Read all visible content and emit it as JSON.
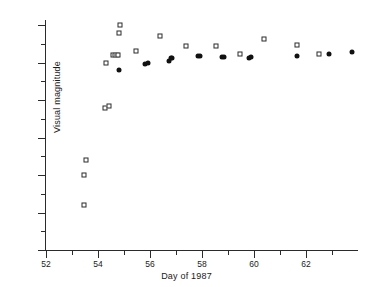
{
  "chart_data": {
    "type": "scatter",
    "title": "",
    "xlabel": "Day of 1987",
    "ylabel": "Visual magnitude",
    "xlim": [
      52,
      64
    ],
    "ylim": [
      7,
      4
    ],
    "y_inverted": true,
    "grid": false,
    "legend": "none",
    "xticks": [
      52,
      54,
      56,
      58,
      60,
      62
    ],
    "xtick_labels": [
      "52",
      "54",
      "56",
      "58",
      "60",
      "62"
    ],
    "xminor_ticks": [
      53,
      55,
      57,
      59,
      61,
      63
    ],
    "yticks": [
      4,
      4.5,
      5,
      5.5,
      6,
      6.5,
      7
    ],
    "ytick_labels": [
      "4",
      "4.5",
      "5",
      "5.5",
      "6",
      "6.5",
      "7"
    ],
    "yminor_ticks": [
      4.25,
      4.75,
      5.25,
      5.75,
      6.25,
      6.75
    ],
    "series": [
      {
        "name": "open-squares",
        "marker": "open-square",
        "points": [
          [
            53.45,
            6.4
          ],
          [
            53.48,
            6.0
          ],
          [
            53.52,
            5.8
          ],
          [
            54.28,
            5.1
          ],
          [
            54.3,
            4.5
          ],
          [
            54.42,
            5.08
          ],
          [
            54.58,
            4.4
          ],
          [
            54.66,
            4.4
          ],
          [
            54.72,
            4.4
          ],
          [
            54.78,
            4.4
          ],
          [
            54.8,
            4.1
          ],
          [
            54.85,
            4.0
          ],
          [
            55.45,
            4.34
          ],
          [
            56.4,
            4.15
          ],
          [
            57.4,
            4.28
          ],
          [
            58.55,
            4.28
          ],
          [
            59.45,
            4.38
          ],
          [
            60.4,
            4.19
          ],
          [
            61.65,
            4.27
          ],
          [
            62.5,
            4.38
          ]
        ]
      },
      {
        "name": "filled-circles",
        "marker": "filled-circle",
        "points": [
          [
            54.8,
            4.6
          ],
          [
            55.82,
            4.52
          ],
          [
            55.92,
            4.51
          ],
          [
            56.72,
            4.48
          ],
          [
            56.8,
            4.44
          ],
          [
            56.84,
            4.44
          ],
          [
            57.85,
            4.41
          ],
          [
            57.92,
            4.41
          ],
          [
            58.78,
            4.43
          ],
          [
            58.86,
            4.42
          ],
          [
            59.8,
            4.44
          ],
          [
            59.9,
            4.43
          ],
          [
            61.65,
            4.41
          ],
          [
            62.9,
            4.39
          ],
          [
            63.75,
            4.36
          ]
        ]
      }
    ]
  },
  "axes": {
    "x_title": "Day of 1987",
    "y_title": "Visual magnitude"
  }
}
